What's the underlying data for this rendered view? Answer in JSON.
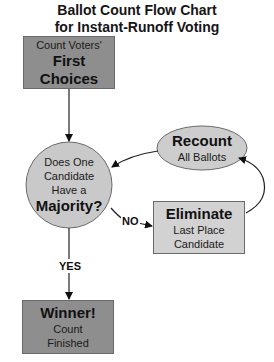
{
  "title": {
    "line1": "Ballot Count Flow Chart",
    "line2": "for Instant-Runoff Voting"
  },
  "nodes": {
    "start": {
      "line1": "Count Voters'",
      "line2": "First Choices",
      "shape": "rectangle",
      "fill": "#8e8e8e"
    },
    "decision": {
      "line1": "Does One",
      "line2": "Candidate",
      "line3": "Have a",
      "line4": "Majority?",
      "shape": "circle",
      "fill": "#c9c9c9"
    },
    "recount": {
      "line1": "Recount",
      "line2": "All Ballots",
      "shape": "ellipse",
      "fill": "#cdcdcd"
    },
    "eliminate": {
      "line1": "Eliminate",
      "line2": "Last Place",
      "line3": "Candidate",
      "shape": "rectangle",
      "fill": "#d2d2d2"
    },
    "winner": {
      "line1": "Winner!",
      "line2": "Count",
      "line3": "Finished",
      "shape": "rectangle",
      "fill": "#8e8e8e"
    }
  },
  "edges": [
    {
      "from": "start",
      "to": "decision",
      "label": ""
    },
    {
      "from": "decision",
      "to": "eliminate",
      "label": "NO"
    },
    {
      "from": "eliminate",
      "to": "recount",
      "label": ""
    },
    {
      "from": "recount",
      "to": "decision",
      "label": ""
    },
    {
      "from": "decision",
      "to": "winner",
      "label": "YES"
    }
  ],
  "labels": {
    "no": "NO",
    "yes": "YES"
  }
}
